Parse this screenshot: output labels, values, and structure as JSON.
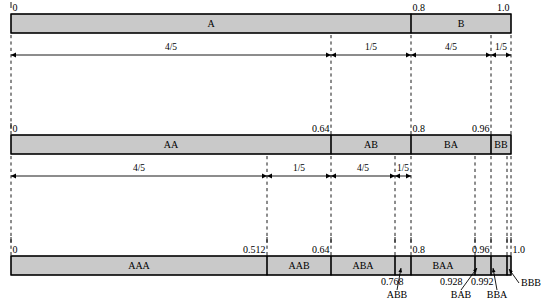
{
  "figure": {
    "title": "",
    "geometry": {
      "x0": 11,
      "x1": 511,
      "bar_height": 19,
      "rows": [
        {
          "id": "row1",
          "bar_top": 14,
          "tick_label_y": 11,
          "arrow_y": 55,
          "dash_bottom": 135
        },
        {
          "id": "row2",
          "bar_top": 135,
          "tick_label_y": 132,
          "arrow_y": 176,
          "dash_bottom": 256
        },
        {
          "id": "row3",
          "bar_top": 256,
          "tick_label_y": 253,
          "arrow_y": null,
          "dash_bottom": null
        }
      ]
    },
    "fill_color": "#c9c9c9",
    "stroke_color": "#000000"
  },
  "row1": {
    "segments": [
      {
        "label": "A",
        "start": 0.0,
        "end": 0.8
      },
      {
        "label": "B",
        "start": 0.8,
        "end": 1.0
      }
    ],
    "ticks": [
      {
        "value": 0.0,
        "text": "0",
        "align": "left"
      },
      {
        "value": 0.8,
        "text": "0.8",
        "align": "left"
      },
      {
        "value": 1.0,
        "text": "1.0",
        "align": "right"
      }
    ],
    "measures": [
      {
        "text": "4/5",
        "start": 0.0,
        "end": 0.64
      },
      {
        "text": "1/5",
        "start": 0.64,
        "end": 0.8
      },
      {
        "text": "4/5",
        "start": 0.8,
        "end": 0.96
      },
      {
        "text": "1/5",
        "start": 0.96,
        "end": 1.0
      }
    ],
    "dashes": [
      0.0,
      0.64,
      0.8,
      0.96,
      1.0
    ]
  },
  "row2": {
    "segments": [
      {
        "label": "AA",
        "start": 0.0,
        "end": 0.64
      },
      {
        "label": "AB",
        "start": 0.64,
        "end": 0.8
      },
      {
        "label": "BA",
        "start": 0.8,
        "end": 0.96
      },
      {
        "label": "BB",
        "start": 0.96,
        "end": 1.0
      }
    ],
    "ticks": [
      {
        "value": 0.0,
        "text": "0",
        "align": "left"
      },
      {
        "value": 0.64,
        "text": "0.64",
        "align": "right"
      },
      {
        "value": 0.8,
        "text": "0.8",
        "align": "left"
      },
      {
        "value": 0.96,
        "text": "0.96",
        "align": "right"
      }
    ],
    "measures": [
      {
        "text": "4/5",
        "start": 0.0,
        "end": 0.512
      },
      {
        "text": "1/5",
        "start": 0.512,
        "end": 0.64
      },
      {
        "text": "4/5",
        "start": 0.64,
        "end": 0.768
      },
      {
        "text": "1/5",
        "start": 0.768,
        "end": 0.8
      }
    ],
    "dashes": [
      0.0,
      0.512,
      0.64,
      0.768,
      0.8
    ]
  },
  "row3": {
    "segments": [
      {
        "label": "AAA",
        "start": 0.0,
        "end": 0.512,
        "inline": true
      },
      {
        "label": "AAB",
        "start": 0.512,
        "end": 0.64,
        "inline": true
      },
      {
        "label": "ABA",
        "start": 0.64,
        "end": 0.768,
        "inline": true
      },
      {
        "label": "ABB",
        "start": 0.768,
        "end": 0.8,
        "inline": false
      },
      {
        "label": "BAA",
        "start": 0.8,
        "end": 0.928,
        "inline": true
      },
      {
        "label": "BAB",
        "start": 0.928,
        "end": 0.96,
        "inline": false
      },
      {
        "label": "BBA",
        "start": 0.96,
        "end": 0.992,
        "inline": false
      },
      {
        "label": "BBB",
        "start": 0.992,
        "end": 1.0,
        "inline": false
      }
    ],
    "ticks": [
      {
        "value": 0.0,
        "text": "0",
        "align": "left"
      },
      {
        "value": 0.512,
        "text": "0.512",
        "align": "right"
      },
      {
        "value": 0.64,
        "text": "0.64",
        "align": "right"
      },
      {
        "value": 0.8,
        "text": "0.8",
        "align": "left"
      },
      {
        "value": 0.96,
        "text": "0.96",
        "align": "right"
      },
      {
        "value": 1.0,
        "text": "1.0",
        "align": "left"
      }
    ],
    "value_callouts": [
      {
        "text": "0.768",
        "value": 0.768,
        "tx": 381,
        "ty": 285,
        "anchor": "start"
      },
      {
        "text": "0.928",
        "value": 0.928,
        "tx": 440,
        "ty": 285,
        "anchor": "start"
      },
      {
        "text": "0.992",
        "value": 0.992,
        "tx": 471,
        "ty": 285,
        "anchor": "start"
      }
    ],
    "name_callouts": [
      {
        "text": "ABB",
        "from_x": 397,
        "from_y": 290,
        "to_x": 401,
        "to_y": 268,
        "tx": 397,
        "ty": 298,
        "anchor": "middle"
      },
      {
        "text": "BAB",
        "from_x": 461,
        "from_y": 290,
        "to_x": 477,
        "to_y": 268,
        "tx": 461,
        "ty": 298,
        "anchor": "middle"
      },
      {
        "text": "BBA",
        "from_x": 497,
        "from_y": 290,
        "to_x": 493,
        "to_y": 268,
        "tx": 497,
        "ty": 298,
        "anchor": "middle"
      },
      {
        "text": "BBB",
        "from_x": 519,
        "from_y": 283,
        "to_x": 509,
        "to_y": 269,
        "tx": 521,
        "ty": 286,
        "anchor": "start"
      }
    ],
    "dashes": [
      0.0,
      0.512,
      0.64,
      0.768,
      0.8,
      0.928,
      0.96,
      0.992,
      1.0
    ]
  }
}
